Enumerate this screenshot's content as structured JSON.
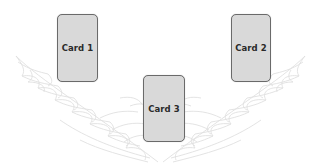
{
  "scene": {
    "background_color": "#ffffff",
    "decoration": "angel-wings-outline",
    "wing_stroke_color": "#e2e2e2"
  },
  "cards": [
    {
      "label": "Card 1",
      "x": 57,
      "y": 14,
      "w": 41,
      "h": 68
    },
    {
      "label": "Card 2",
      "x": 231,
      "y": 14,
      "w": 40,
      "h": 68
    },
    {
      "label": "Card 3",
      "x": 143,
      "y": 75,
      "w": 42,
      "h": 67
    }
  ],
  "card_style": {
    "fill": "#d9d9d9",
    "border": "#6a6a6a",
    "text": "#2a2a2a"
  }
}
